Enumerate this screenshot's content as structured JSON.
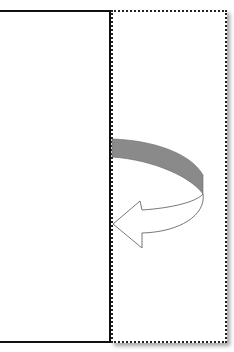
{
  "diagram": {
    "panels": [
      {
        "id": "left-panel",
        "border": "solid",
        "border_color": "#111111"
      },
      {
        "id": "right-panel",
        "border": "dotted",
        "border_color": "#222222"
      }
    ],
    "arrow": {
      "direction": "right-to-left",
      "band_color": "#8a8a8a",
      "head_fill": "#ffffff",
      "outline_color": "#555555"
    }
  }
}
